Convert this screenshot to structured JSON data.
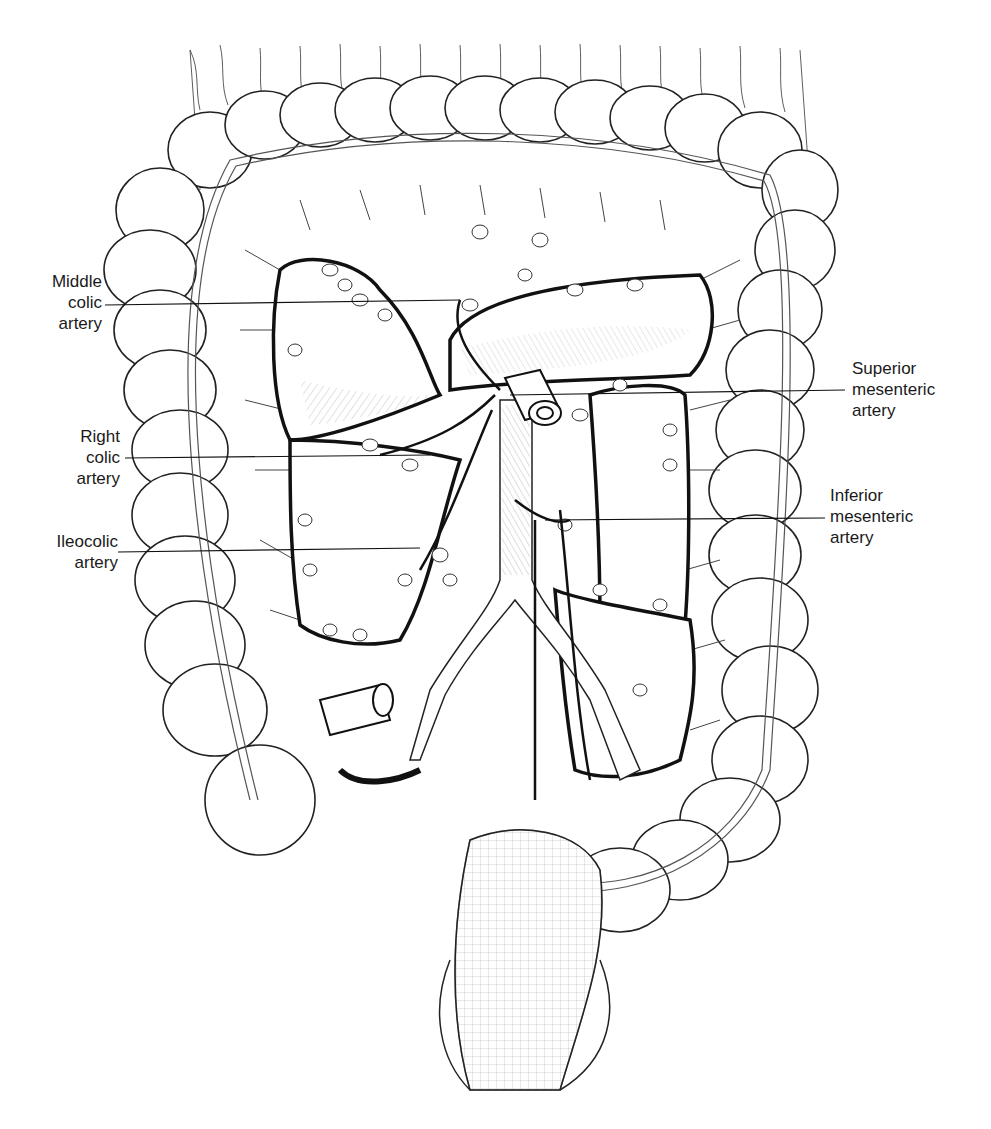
{
  "figure": {
    "background": "#ffffff",
    "ink": "#1a1a1a"
  },
  "labels": {
    "middle_colic": {
      "lines": [
        "Middle",
        "colic",
        "artery"
      ]
    },
    "right_colic": {
      "lines": [
        "Right",
        "colic",
        "artery"
      ]
    },
    "ileocolic": {
      "lines": [
        "Ileocolic",
        "artery"
      ]
    },
    "superior_mesenteric": {
      "lines": [
        "Superior",
        "mesenteric",
        "artery"
      ]
    },
    "inferior_mesenteric": {
      "lines": [
        "Inferior",
        "mesenteric",
        "artery"
      ]
    }
  }
}
